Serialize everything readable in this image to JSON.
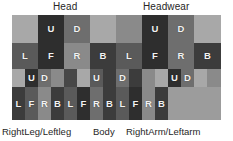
{
  "diagram": {
    "title_labels": {
      "head": "Head",
      "headwear": "Headwear"
    },
    "bottom_labels": {
      "legs": "RightLeg/Leftleg",
      "body": "Body",
      "arms": "RightArm/Leftarm"
    },
    "face_key": {
      "U": "Up",
      "D": "Down",
      "L": "Left",
      "F": "Front",
      "R": "Right",
      "B": "Back"
    },
    "colors": {
      "light": "#a8a8a8",
      "mid": "#6e6e6e",
      "dark": "#3c3c3c",
      "darker": "#2e2e2e",
      "grey": "#8a8a8a",
      "dimgrey": "#5a5a5a",
      "empty": "#9c9c9c",
      "void": "#474747",
      "text": "#f2f2f2",
      "label_text": "#262626",
      "background": "#ffffff"
    },
    "rows": [
      {
        "name": "row-head-top",
        "cells": [
          {
            "label": "",
            "tone": "t-light",
            "w": 26
          },
          {
            "label": "U",
            "tone": "t-darker",
            "w": 26
          },
          {
            "label": "D",
            "tone": "t-mid",
            "w": 26
          },
          {
            "label": "",
            "tone": "t-light",
            "w": 26
          },
          {
            "label": "",
            "tone": "t-grey",
            "w": 26
          },
          {
            "label": "U",
            "tone": "t-darker",
            "w": 26
          },
          {
            "label": "D",
            "tone": "t-mid",
            "w": 26
          },
          {
            "label": "",
            "tone": "t-light",
            "w": 27
          }
        ]
      },
      {
        "name": "row-head-sides",
        "cells": [
          {
            "label": "L",
            "tone": "t-dimgrey",
            "w": 26
          },
          {
            "label": "F",
            "tone": "t-darker",
            "w": 26
          },
          {
            "label": "R",
            "tone": "t-grey",
            "w": 26
          },
          {
            "label": "B",
            "tone": "t-dark",
            "w": 26
          },
          {
            "label": "L",
            "tone": "t-dimgrey",
            "w": 26
          },
          {
            "label": "F",
            "tone": "t-darker",
            "w": 26
          },
          {
            "label": "R",
            "tone": "t-mid",
            "w": 26
          },
          {
            "label": "B",
            "tone": "t-dark",
            "w": 27
          }
        ]
      },
      {
        "name": "row-limbs-top",
        "cells": [
          {
            "label": "",
            "tone": "t-light",
            "w": 13
          },
          {
            "label": "U",
            "tone": "t-darker",
            "w": 13
          },
          {
            "label": "D",
            "tone": "t-mid",
            "w": 13
          },
          {
            "label": "",
            "tone": "t-grey",
            "w": 13
          },
          {
            "label": "",
            "tone": "t-void",
            "w": 13
          },
          {
            "label": "",
            "tone": "t-light",
            "w": 13
          },
          {
            "label": "U",
            "tone": "t-dimgrey",
            "w": 13
          },
          {
            "label": "",
            "tone": "t-dark",
            "w": 13
          },
          {
            "label": "D",
            "tone": "t-mid",
            "w": 13
          },
          {
            "label": "",
            "tone": "t-dark",
            "w": 13
          },
          {
            "label": "",
            "tone": "t-grey",
            "w": 13
          },
          {
            "label": "",
            "tone": "t-light",
            "w": 13
          },
          {
            "label": "U",
            "tone": "t-darker",
            "w": 13
          },
          {
            "label": "D",
            "tone": "t-mid",
            "w": 13
          },
          {
            "label": "",
            "tone": "t-light",
            "w": 13
          },
          {
            "label": "",
            "tone": "t-grey",
            "w": 14
          }
        ]
      },
      {
        "name": "row-limbs-sides",
        "cells": [
          {
            "label": "L",
            "tone": "t-dark",
            "w": 13
          },
          {
            "label": "F",
            "tone": "t-dimgrey",
            "w": 13
          },
          {
            "label": "R",
            "tone": "t-grey",
            "w": 13
          },
          {
            "label": "B",
            "tone": "t-dark",
            "w": 13
          },
          {
            "label": "L",
            "tone": "t-dimgrey",
            "w": 13
          },
          {
            "label": "F",
            "tone": "t-darker",
            "w": 13
          },
          {
            "label": "R",
            "tone": "t-mid",
            "w": 13
          },
          {
            "label": "B",
            "tone": "t-dark",
            "w": 13
          },
          {
            "label": "L",
            "tone": "t-dimgrey",
            "w": 13
          },
          {
            "label": "F",
            "tone": "t-darker",
            "w": 13
          },
          {
            "label": "R",
            "tone": "t-grey",
            "w": 13
          },
          {
            "label": "B",
            "tone": "t-dark",
            "w": 13
          },
          {
            "label": "",
            "tone": "t-empty",
            "w": 13
          },
          {
            "label": "",
            "tone": "t-empty",
            "w": 13
          },
          {
            "label": "",
            "tone": "t-empty",
            "w": 13
          },
          {
            "label": "",
            "tone": "t-empty",
            "w": 14
          }
        ]
      }
    ]
  }
}
